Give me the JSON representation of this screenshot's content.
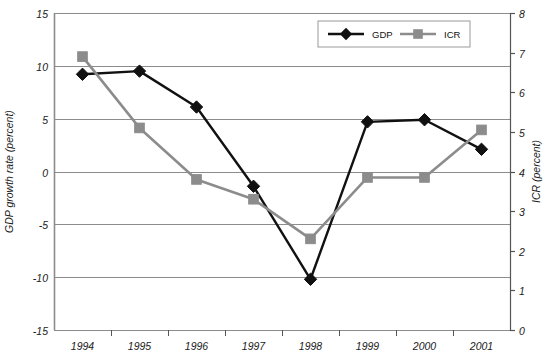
{
  "chart_data": {
    "type": "line",
    "title": "",
    "subtitle": "",
    "categories": [
      "1994",
      "1995",
      "1996",
      "1997",
      "1998",
      "1999",
      "2000",
      "2001"
    ],
    "series": [
      {
        "name": "GDP",
        "axis": "left",
        "color": "#111111",
        "marker": "diamond",
        "values": [
          9.2,
          9.5,
          6.1,
          -1.4,
          -10.2,
          4.7,
          4.9,
          2.1
        ]
      },
      {
        "name": "ICR",
        "axis": "right",
        "color": "#8c8c8c",
        "marker": "square",
        "values": [
          6.9,
          5.1,
          3.8,
          3.3,
          2.3,
          3.85,
          3.85,
          5.05
        ]
      }
    ],
    "xlabel": "",
    "ylabel": "GDP growth rate (percent)",
    "y2label": "ICR (percent)",
    "ylim": [
      -15,
      15
    ],
    "y2lim": [
      0,
      8
    ],
    "yticks": [
      "15",
      "10",
      "5",
      "0",
      "-5",
      "-10",
      "-15"
    ],
    "y2ticks": [
      "8",
      "7",
      "6",
      "5",
      "4",
      "3",
      "2",
      "1",
      "0"
    ],
    "grid": true,
    "legend_position": "top-right",
    "gridline_color": "#8c8c8c",
    "axis_color": "#8c8c8c"
  },
  "legend": {
    "items": [
      {
        "label": "GDP",
        "marker": "diamond-marker",
        "color": "#111111"
      },
      {
        "label": "ICR",
        "marker": "square-marker",
        "color": "#8c8c8c"
      }
    ]
  },
  "axes": {
    "left_title": "GDP growth rate (percent)",
    "right_title": "ICR (percent)"
  }
}
